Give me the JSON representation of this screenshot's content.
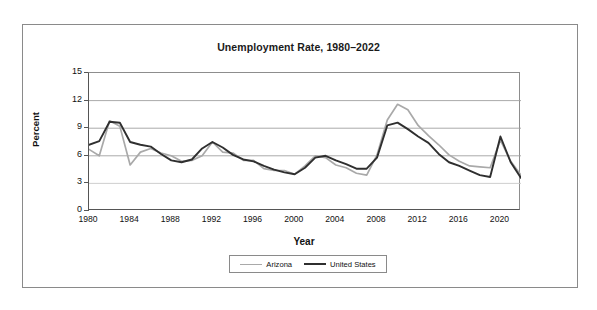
{
  "figure": {
    "title": "Unemployment Rate, 1980–2022",
    "x_axis_label": "Year",
    "y_axis_label": "Percent"
  },
  "legend": {
    "entries": [
      {
        "label": "Arizona",
        "color": "#a9a9a9"
      },
      {
        "label": "United States",
        "color": "#2f2f2f"
      }
    ]
  },
  "axes": {
    "y_ticks": [
      "0",
      "3",
      "6",
      "9",
      "12",
      "15"
    ],
    "x_ticks": [
      "1980",
      "1984",
      "1988",
      "1992",
      "1996",
      "2000",
      "2004",
      "2008",
      "2012",
      "2016",
      "2020"
    ]
  },
  "chart_data": {
    "type": "line",
    "title": "Unemployment Rate, 1980–2022",
    "xlabel": "Year",
    "ylabel": "Percent",
    "xlim": [
      1980,
      2022
    ],
    "ylim": [
      0,
      15
    ],
    "ytick_step": 3,
    "xtick_step": 4,
    "x_minor_ticks": 1,
    "grid": "horizontal",
    "legend_position": "bottom-center",
    "x": [
      1980,
      1981,
      1982,
      1983,
      1984,
      1985,
      1986,
      1987,
      1988,
      1989,
      1990,
      1991,
      1992,
      1993,
      1994,
      1995,
      1996,
      1997,
      1998,
      1999,
      2000,
      2001,
      2002,
      2003,
      2004,
      2005,
      2006,
      2007,
      2008,
      2009,
      2010,
      2011,
      2012,
      2013,
      2014,
      2015,
      2016,
      2017,
      2018,
      2019,
      2020,
      2021,
      2022
    ],
    "series": [
      {
        "name": "Arizona",
        "color": "#a9a9a9",
        "values": [
          6.7,
          6.0,
          9.8,
          9.2,
          5.0,
          6.4,
          6.8,
          6.3,
          6.0,
          5.4,
          5.5,
          6.0,
          7.5,
          6.4,
          6.3,
          5.5,
          5.5,
          4.6,
          4.4,
          4.4,
          4.0,
          4.9,
          6.0,
          5.8,
          5.0,
          4.7,
          4.1,
          3.9,
          6.1,
          9.9,
          11.6,
          11.0,
          9.3,
          8.2,
          7.2,
          6.1,
          5.4,
          4.9,
          4.8,
          4.7,
          7.7,
          5.4,
          3.9
        ]
      },
      {
        "name": "United States",
        "color": "#2f2f2f",
        "values": [
          7.2,
          7.6,
          9.7,
          9.6,
          7.5,
          7.2,
          7.0,
          6.2,
          5.5,
          5.3,
          5.6,
          6.8,
          7.5,
          6.9,
          6.1,
          5.6,
          5.4,
          4.9,
          4.5,
          4.2,
          4.0,
          4.7,
          5.8,
          6.0,
          5.5,
          5.1,
          4.6,
          4.6,
          5.8,
          9.3,
          9.6,
          8.9,
          8.1,
          7.4,
          6.2,
          5.3,
          4.9,
          4.4,
          3.9,
          3.7,
          8.1,
          5.3,
          3.6
        ]
      }
    ]
  }
}
